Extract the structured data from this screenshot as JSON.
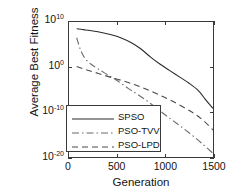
{
  "chart_data": {
    "type": "line",
    "title": "",
    "xlabel": "Generation",
    "ylabel": "Average Best Fitness",
    "xlim": [
      0,
      1500
    ],
    "ylim_log10": [
      -20,
      10
    ],
    "yscale": "log",
    "grid": false,
    "legend_position": "lower left",
    "xticks": [
      {
        "value": 0,
        "label": "0"
      },
      {
        "value": 500,
        "label": "500"
      },
      {
        "value": 1000,
        "label": "1000"
      },
      {
        "value": 1500,
        "label": "1500"
      }
    ],
    "yticks": [
      {
        "exponent": 10,
        "base": "10",
        "label": "10^10"
      },
      {
        "exponent": 0,
        "base": "10",
        "label": "10^0"
      },
      {
        "exponent": -10,
        "base": "10",
        "label": "10^-10"
      },
      {
        "exponent": -20,
        "base": "10",
        "label": "10^-20"
      }
    ],
    "series": [
      {
        "name": "SPSO",
        "style": "solid",
        "color": "#2b2b2b",
        "x": [
          80,
          150,
          250,
          350,
          450,
          550,
          650,
          750,
          850,
          950,
          1050,
          1150,
          1250,
          1350,
          1420,
          1500
        ],
        "y_log10": [
          8.5,
          8.3,
          8.0,
          7.6,
          7.1,
          6.4,
          5.4,
          4.0,
          2.2,
          0.6,
          -0.8,
          -2.2,
          -3.6,
          -5.3,
          -7.2,
          -9.2
        ]
      },
      {
        "name": "PSO-TVV",
        "style": "dashdot",
        "color": "#6b6b6b",
        "x": [
          80,
          120,
          170,
          230,
          300,
          400,
          500,
          620,
          750,
          880,
          1000,
          1120,
          1250,
          1380,
          1500
        ],
        "y_log10": [
          6.5,
          3.8,
          1.8,
          0.6,
          -0.4,
          -1.7,
          -3.0,
          -4.8,
          -6.6,
          -8.6,
          -10.6,
          -12.5,
          -14.6,
          -16.9,
          -19.2
        ]
      },
      {
        "name": "PSO-LPD",
        "style": "dashed",
        "color": "#4a4a4a",
        "x": [
          80,
          180,
          300,
          420,
          550,
          680,
          800,
          920,
          1050,
          1180,
          1300,
          1400,
          1500
        ],
        "y_log10": [
          0.1,
          -0.6,
          -1.4,
          -2.2,
          -3.0,
          -3.9,
          -4.9,
          -6.0,
          -7.3,
          -8.8,
          -10.3,
          -11.9,
          -14.0
        ]
      }
    ]
  },
  "legend": {
    "entries": [
      {
        "label": "SPSO",
        "style": "solid"
      },
      {
        "label": "PSO-TVV",
        "style": "dashdot"
      },
      {
        "label": "PSO-LPD",
        "style": "dashed"
      }
    ]
  }
}
